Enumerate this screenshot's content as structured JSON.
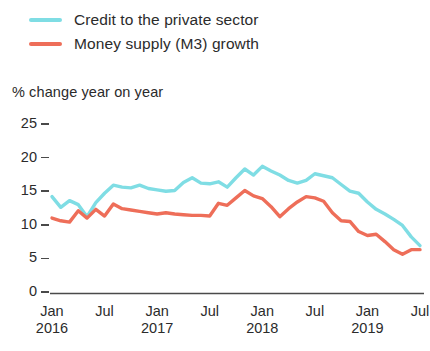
{
  "chart_data": {
    "type": "line",
    "title": "",
    "subtitle": "",
    "ylabel": "% change year on year",
    "xlabel": "",
    "ylim": [
      0,
      25
    ],
    "yticks": [
      0,
      5,
      10,
      15,
      20,
      25
    ],
    "ytick_labels": [
      "0",
      "5",
      "10",
      "15",
      "20",
      "25"
    ],
    "grid": false,
    "legend_position": "top-left",
    "x": [
      "Jan 2016",
      "Feb 2016",
      "Mar 2016",
      "Apr 2016",
      "May 2016",
      "Jun 2016",
      "Jul 2016",
      "Aug 2016",
      "Sep 2016",
      "Oct 2016",
      "Nov 2016",
      "Dec 2016",
      "Jan 2017",
      "Feb 2017",
      "Mar 2017",
      "Apr 2017",
      "May 2017",
      "Jun 2017",
      "Jul 2017",
      "Aug 2017",
      "Sep 2017",
      "Oct 2017",
      "Nov 2017",
      "Dec 2017",
      "Jan 2018",
      "Feb 2018",
      "Mar 2018",
      "Apr 2018",
      "May 2018",
      "Jun 2018",
      "Jul 2018",
      "Aug 2018",
      "Sep 2018",
      "Oct 2018",
      "Nov 2018",
      "Dec 2018",
      "Jan 2019",
      "Feb 2019",
      "Mar 2019",
      "Apr 2019",
      "May 2019",
      "Jun 2019",
      "Jul 2019"
    ],
    "xtick_labels": [
      {
        "month": "Jan",
        "year": "2016"
      },
      {
        "month": "Jul",
        "year": ""
      },
      {
        "month": "Jan",
        "year": "2017"
      },
      {
        "month": "Jul",
        "year": ""
      },
      {
        "month": "Jan",
        "year": "2018"
      },
      {
        "month": "Jul",
        "year": ""
      },
      {
        "month": "Jan",
        "year": "2019"
      },
      {
        "month": "Jul",
        "year": ""
      }
    ],
    "series": [
      {
        "name": "Credit to the private sector",
        "color": "#7FDDE4",
        "values": [
          14.2,
          12.6,
          13.6,
          13.0,
          11.2,
          13.3,
          14.7,
          15.9,
          15.6,
          15.5,
          15.9,
          15.4,
          15.2,
          15.0,
          15.1,
          16.3,
          17.0,
          16.2,
          16.1,
          16.4,
          15.6,
          17.0,
          18.3,
          17.4,
          18.7,
          18.0,
          17.4,
          16.6,
          16.2,
          16.6,
          17.6,
          17.3,
          17.0,
          16.0,
          15.0,
          14.7,
          13.4,
          12.3,
          11.6,
          10.8,
          9.9,
          8.2,
          6.9
        ]
      },
      {
        "name": "Money supply (M3) growth",
        "color": "#EE6E59",
        "values": [
          11.0,
          10.6,
          10.4,
          12.1,
          11.0,
          12.3,
          11.3,
          13.1,
          12.4,
          12.2,
          12.0,
          11.8,
          11.6,
          11.8,
          11.6,
          11.5,
          11.4,
          11.4,
          11.3,
          13.2,
          12.9,
          14.0,
          15.1,
          14.3,
          13.9,
          12.7,
          11.2,
          12.4,
          13.4,
          14.2,
          14.0,
          13.5,
          11.8,
          10.6,
          10.5,
          9.0,
          8.4,
          8.6,
          7.5,
          6.3,
          5.6,
          6.3,
          6.3
        ]
      }
    ]
  },
  "legend": {
    "items": [
      {
        "label": "Credit to the private sector",
        "color": "#7FDDE4"
      },
      {
        "label": "Money supply (M3) growth",
        "color": "#EE6E59"
      }
    ]
  },
  "axis": {
    "y_title": "% change year on year"
  }
}
